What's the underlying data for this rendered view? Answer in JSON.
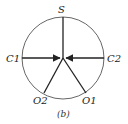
{
  "diagram": {
    "caption": "(b)",
    "circle": {
      "cx": 63,
      "cy": 58,
      "r": 41,
      "stroke": "#555555"
    },
    "center": {
      "x": 63,
      "y": 58
    },
    "nodes": [
      {
        "id": "S",
        "label": "S",
        "x": 63,
        "y": 17,
        "arrow_to_center": false
      },
      {
        "id": "C1",
        "label": "C1",
        "x": 22,
        "y": 58,
        "arrow_to_center": true
      },
      {
        "id": "C2",
        "label": "C2",
        "x": 104,
        "y": 58,
        "arrow_to_center": true
      },
      {
        "id": "O2",
        "label": "O2",
        "x": 44,
        "y": 93,
        "arrow_to_center": false
      },
      {
        "id": "O1",
        "label": "O1",
        "x": 86,
        "y": 93,
        "arrow_to_center": false
      }
    ]
  }
}
